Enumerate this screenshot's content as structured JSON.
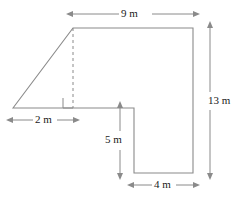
{
  "figure": {
    "type": "geometry-diagram",
    "units": "m",
    "stroke_color": "#8a8a8a",
    "text_color": "#1a1a1a",
    "background": "#ffffff"
  },
  "dimensions": [
    {
      "id": "top",
      "label": "9 m",
      "value": 9,
      "orientation": "horizontal",
      "position": "top"
    },
    {
      "id": "base-left",
      "label": "2 m",
      "value": 2,
      "orientation": "horizontal",
      "position": "below-left"
    },
    {
      "id": "right",
      "label": "13 m",
      "value": 13,
      "orientation": "vertical",
      "position": "right"
    },
    {
      "id": "notch-left",
      "label": "5 m",
      "value": 5,
      "orientation": "vertical",
      "position": "inner-left"
    },
    {
      "id": "bottom",
      "label": "4 m",
      "value": 4,
      "orientation": "horizontal",
      "position": "bottom"
    }
  ],
  "markers": [
    {
      "id": "right-angle",
      "label": "right-angle-marker"
    }
  ]
}
